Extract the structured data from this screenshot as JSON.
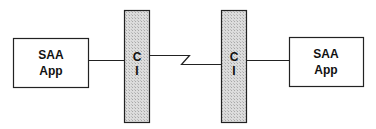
{
  "diagram": {
    "left_app": {
      "line1": "SAA",
      "line2": "App"
    },
    "left_interface": {
      "line1": "C",
      "line2": "I"
    },
    "right_interface": {
      "line1": "C",
      "line2": "I"
    },
    "right_app": {
      "line1": "SAA",
      "line2": "App"
    },
    "connection": "communications link"
  },
  "colors": {
    "stroke": "#222222",
    "bar_fill": "#d8d8d8",
    "box_fill": "#ffffff"
  }
}
